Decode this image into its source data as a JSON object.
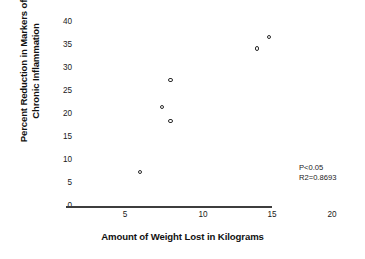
{
  "chart_data": {
    "type": "scatter",
    "title": "",
    "xlabel": "Amount of Weight Lost in Kilograms",
    "ylabel_line1": "Percent Reduction in Markers of",
    "ylabel_line2": "Chronic Inflammation",
    "xlim": [
      0,
      21
    ],
    "ylim": [
      0,
      40
    ],
    "xticks": [
      5,
      10,
      15,
      20
    ],
    "yticks": [
      0,
      5,
      10,
      15,
      20,
      25,
      30,
      35,
      40
    ],
    "xtick_labels": [
      "5",
      "10",
      "15",
      "20"
    ],
    "ytick_labels": [
      "0",
      "5",
      "10",
      "15",
      "20",
      "25",
      "30",
      "35",
      "40"
    ],
    "grid": false,
    "legend": false,
    "marker_style": "open-circle",
    "points": [
      {
        "x": 6.0,
        "y": 7.2
      },
      {
        "x": 7.5,
        "y": 21.3
      },
      {
        "x": 8.1,
        "y": 27.2
      },
      {
        "x": 8.1,
        "y": 18.3
      },
      {
        "x": 14.0,
        "y": 34.0
      },
      {
        "x": 14.8,
        "y": 36.5
      }
    ],
    "annotations": [
      {
        "text": "P<0.05"
      },
      {
        "text": "R2=0.8693"
      }
    ],
    "annotation_lines": [
      "P<0.05",
      "R2=0.8693"
    ],
    "colors": {
      "marker_stroke": "#2b2b2b",
      "axis": "#3d3d3d",
      "text": "#111111",
      "background": "#ffffff"
    }
  }
}
